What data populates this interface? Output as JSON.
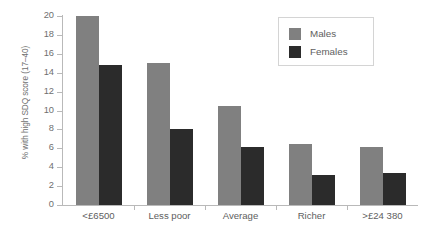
{
  "chart_data": {
    "type": "bar",
    "title": "",
    "xlabel": "",
    "ylabel": "% with high SDQ score (17–40)",
    "ylim": [
      0,
      20
    ],
    "yticks": [
      0,
      2,
      4,
      6,
      8,
      10,
      12,
      14,
      16,
      18,
      20
    ],
    "ytick_labels": [
      "0",
      "2",
      "4",
      "6",
      "8",
      "10",
      "12",
      "14",
      "16",
      "18",
      "20"
    ],
    "grid": false,
    "legend_position": "top-right",
    "categories": [
      "<£6500",
      "Less poor",
      "Average",
      "Richer",
      ">£24 380"
    ],
    "series": [
      {
        "name": "Males",
        "color": "#808080",
        "values": [
          20.0,
          15.0,
          10.5,
          6.5,
          6.1
        ]
      },
      {
        "name": "Females",
        "color": "#2b2b2b",
        "values": [
          14.8,
          8.0,
          6.1,
          3.2,
          3.4
        ]
      }
    ]
  },
  "legend": {
    "entries": [
      {
        "label": "Males"
      },
      {
        "label": "Females"
      }
    ]
  }
}
